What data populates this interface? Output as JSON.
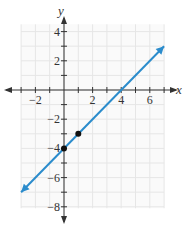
{
  "chart_data": {
    "type": "line",
    "title": "",
    "xlabel": "x",
    "ylabel": "y",
    "xlim": [
      -3,
      7
    ],
    "ylim": [
      -8,
      4
    ],
    "x_ticks": [
      -2,
      2,
      4,
      6
    ],
    "y_ticks": [
      4,
      2,
      -2,
      -4,
      -6,
      -8
    ],
    "x_tick_labels": [
      "−2",
      "2",
      "4",
      "6"
    ],
    "y_tick_labels": [
      "4",
      "2",
      "−2",
      "−4",
      "−6",
      "−8"
    ],
    "grid": true,
    "series": [
      {
        "name": "line",
        "equation": "y = x - 4",
        "slope": 1,
        "intercept": -4,
        "x": [
          -3,
          7
        ],
        "y": [
          -7,
          3
        ],
        "color": "#2b8ccc",
        "arrows": "both"
      }
    ],
    "points": [
      {
        "x": 0,
        "y": -4
      },
      {
        "x": 1,
        "y": -3
      }
    ]
  }
}
